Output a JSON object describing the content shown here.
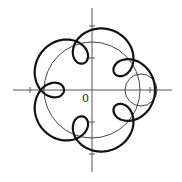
{
  "diagram": {
    "type": "epitrochoid-curve",
    "origin_label": "0",
    "origin_px": [
      92,
      90
    ],
    "axes": {
      "x_range_px": [
        13,
        172
      ],
      "y_range_px": [
        8,
        172
      ],
      "ticks_x_px": [
        30,
        150
      ],
      "ticks_y_px": [
        26,
        58,
        122,
        154
      ]
    },
    "base_circle": {
      "cx": 92,
      "cy": 90,
      "r": 48
    },
    "rolling_circle": {
      "cx": 141,
      "cy": 90,
      "r": 16
    },
    "curve": {
      "A": 45.5,
      "B": 17.5,
      "freq": 6,
      "loops": 5
    },
    "colors": {
      "curve": "#111111",
      "circle": "#444444",
      "axis": "#555555"
    }
  }
}
